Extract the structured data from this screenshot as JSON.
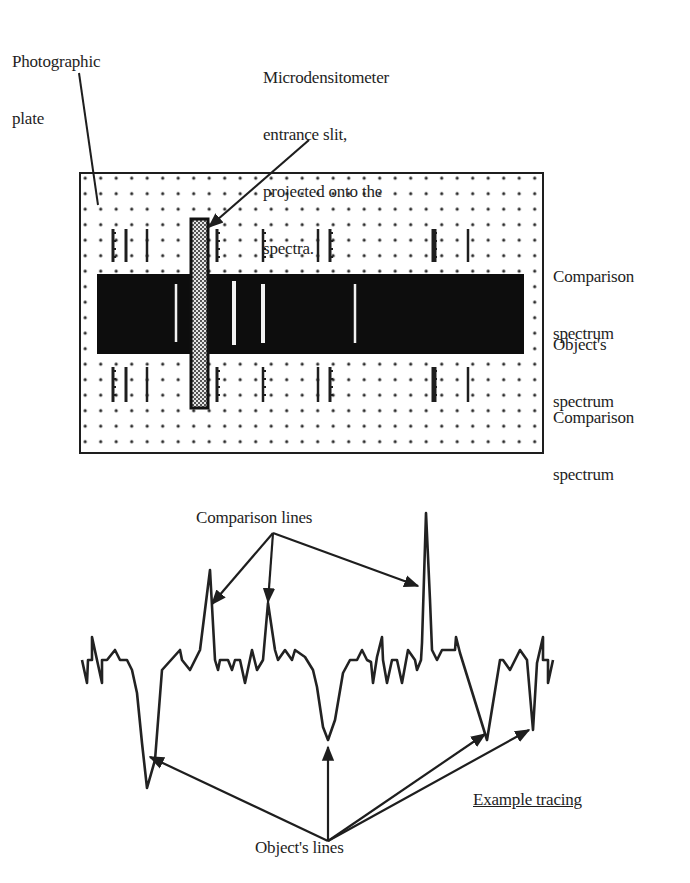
{
  "labels": {
    "photographic_plate": [
      "Photographic",
      "plate"
    ],
    "slit": [
      "Microdensitometer",
      "entrance slit,",
      "projected onto the",
      "spectra."
    ],
    "comparison_top": [
      "Comparison",
      "spectrum"
    ],
    "object_spectrum": [
      "Object's",
      "spectrum"
    ],
    "comparison_bottom": [
      "Comparison",
      "spectrum"
    ],
    "comparison_lines": "Comparison lines",
    "object_lines": "Object's lines",
    "example_tracing": "Example tracing"
  },
  "colors": {
    "ink": "#1e1e1e",
    "band": "#0d0d0d",
    "plate_bg": "#ffffff",
    "dot": "#2a2a2a",
    "slit_fill": "#9a9a9a",
    "emission_line": "#f2f2f2"
  },
  "plate": {
    "rect": [
      80,
      173,
      463,
      280
    ],
    "dot_spacing": 15.5,
    "band": [
      97,
      274,
      427,
      80
    ],
    "slit": [
      191,
      219,
      17,
      189
    ],
    "comparison_lines_top_y": [
      229,
      262
    ],
    "comparison_lines_bottom_y": [
      367,
      402
    ],
    "comparison_lines": [
      {
        "x": 113,
        "w": 3,
        "ticks": true
      },
      {
        "x": 126,
        "w": 3,
        "ticks": false
      },
      {
        "x": 147,
        "w": 2.5,
        "ticks": false
      },
      {
        "x": 217,
        "w": 3,
        "ticks": true
      },
      {
        "x": 263,
        "w": 2.5,
        "ticks": true
      },
      {
        "x": 318,
        "w": 2.5,
        "ticks": false
      },
      {
        "x": 330,
        "w": 3,
        "ticks": true
      },
      {
        "x": 434,
        "w": 5,
        "ticks": true
      },
      {
        "x": 468,
        "w": 2.5,
        "ticks": false
      }
    ],
    "object_emission_lines": [
      {
        "x": 176,
        "y1": 284,
        "y2": 342,
        "w": 2.5
      },
      {
        "x": 234,
        "y1": 281,
        "y2": 345,
        "w": 4
      },
      {
        "x": 263,
        "y1": 284,
        "y2": 343,
        "w": 4
      },
      {
        "x": 355,
        "y1": 284,
        "y2": 343,
        "w": 2.5
      }
    ]
  },
  "pointers": {
    "plate_pointer": [
      [
        79,
        73
      ],
      [
        98,
        205
      ]
    ],
    "slit_pointer": [
      [
        309,
        140
      ],
      [
        209,
        227
      ]
    ]
  },
  "chart_data": {
    "type": "line",
    "title": "Example tracing",
    "xlabel": "",
    "ylabel": "",
    "annotations": [
      "Comparison lines",
      "Object's lines"
    ],
    "trace": [
      [
        82,
        660
      ],
      [
        87,
        683
      ],
      [
        88,
        660
      ],
      [
        92,
        660
      ],
      [
        92,
        637
      ],
      [
        97,
        660
      ],
      [
        102,
        683
      ],
      [
        102,
        660
      ],
      [
        107,
        660
      ],
      [
        115,
        650
      ],
      [
        120,
        660
      ],
      [
        127,
        660
      ],
      [
        132,
        670
      ],
      [
        137,
        693
      ],
      [
        142,
        743
      ],
      [
        147,
        788
      ],
      [
        155,
        760
      ],
      [
        162,
        670
      ],
      [
        180,
        650
      ],
      [
        182,
        660
      ],
      [
        190,
        670
      ],
      [
        200,
        650
      ],
      [
        205,
        610
      ],
      [
        210,
        570
      ],
      [
        215,
        660
      ],
      [
        218,
        670
      ],
      [
        220,
        660
      ],
      [
        228,
        660
      ],
      [
        232,
        670
      ],
      [
        235,
        660
      ],
      [
        240,
        660
      ],
      [
        245,
        683
      ],
      [
        252,
        650
      ],
      [
        257,
        670
      ],
      [
        263,
        660
      ],
      [
        268,
        603
      ],
      [
        275,
        650
      ],
      [
        278,
        660
      ],
      [
        285,
        650
      ],
      [
        292,
        660
      ],
      [
        295,
        650
      ],
      [
        305,
        657
      ],
      [
        313,
        670
      ],
      [
        317,
        687
      ],
      [
        323,
        727
      ],
      [
        328,
        740
      ],
      [
        335,
        720
      ],
      [
        343,
        673
      ],
      [
        350,
        660
      ],
      [
        357,
        660
      ],
      [
        362,
        650
      ],
      [
        367,
        660
      ],
      [
        371,
        662
      ],
      [
        373,
        683
      ],
      [
        377,
        657
      ],
      [
        382,
        637
      ],
      [
        383,
        660
      ],
      [
        387,
        683
      ],
      [
        392,
        660
      ],
      [
        397,
        660
      ],
      [
        402,
        683
      ],
      [
        408,
        650
      ],
      [
        415,
        660
      ],
      [
        417,
        670
      ],
      [
        421,
        660
      ],
      [
        422,
        643
      ],
      [
        426,
        513
      ],
      [
        430,
        600
      ],
      [
        432,
        650
      ],
      [
        437,
        660
      ],
      [
        442,
        650
      ],
      [
        455,
        650
      ],
      [
        456,
        637
      ],
      [
        460,
        653
      ],
      [
        487,
        740
      ],
      [
        500,
        660
      ],
      [
        503,
        660
      ],
      [
        510,
        670
      ],
      [
        520,
        650
      ],
      [
        527,
        660
      ],
      [
        533,
        730
      ],
      [
        537,
        663
      ],
      [
        543,
        637
      ],
      [
        543,
        660
      ],
      [
        548,
        660
      ],
      [
        548,
        683
      ],
      [
        553,
        660
      ]
    ],
    "comparison_arrows": {
      "from": [
        273,
        533
      ],
      "to": [
        [
          212,
          604
        ],
        [
          268,
          602
        ],
        [
          418,
          586
        ]
      ]
    },
    "object_arrows": {
      "from": [
        328,
        841
      ],
      "to": [
        [
          150,
          757
        ],
        [
          328,
          747
        ],
        [
          485,
          734
        ],
        [
          529,
          730
        ]
      ]
    }
  }
}
